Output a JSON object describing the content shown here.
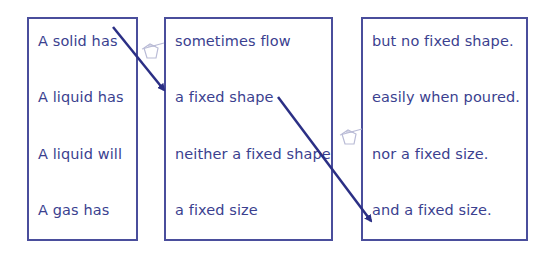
{
  "exercise": {
    "columns": [
      {
        "name": "subjects",
        "items": [
          "A solid has",
          "A liquid has",
          "A liquid will",
          "A gas has"
        ]
      },
      {
        "name": "middles",
        "items": [
          "sometimes flow",
          "a fixed shape",
          "neither a fixed shape",
          "a fixed size"
        ]
      },
      {
        "name": "endings",
        "items": [
          "but no fixed shape.",
          "easily when poured.",
          "nor a fixed size.",
          "and a fixed size."
        ]
      }
    ],
    "connections": [
      {
        "from": "A solid has",
        "to": "a fixed shape"
      },
      {
        "from": "a fixed shape",
        "to": "and a fixed size."
      }
    ],
    "colors": {
      "border": "#4a4e9c",
      "text": "#3b3f8f",
      "arrow": "#2b2f85",
      "pencil": "#b9bbd6"
    }
  }
}
